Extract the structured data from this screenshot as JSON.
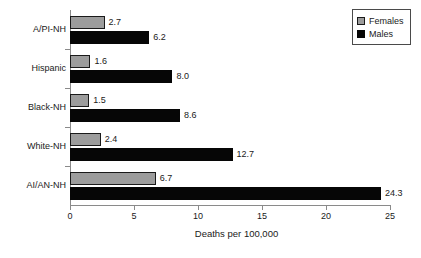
{
  "chart_data": {
    "type": "bar",
    "orientation": "horizontal",
    "title": "",
    "xlabel": "Deaths per 100,000",
    "ylabel": "",
    "categories": [
      "A/PI-NH",
      "Hispanic",
      "Black-NH",
      "White-NH",
      "AI/AN-NH"
    ],
    "series": [
      {
        "name": "Females",
        "color": "#9c9c9c",
        "values": [
          2.7,
          1.6,
          1.5,
          2.4,
          6.7
        ],
        "labels": [
          "2.7",
          "1.6",
          "1.5",
          "2.4",
          "6.7"
        ]
      },
      {
        "name": "Males",
        "color": "#060606",
        "values": [
          6.2,
          8.0,
          8.6,
          12.7,
          24.3
        ],
        "labels": [
          "6.2",
          "8.0",
          "8.6",
          "12.7",
          "24.3"
        ]
      }
    ],
    "xlim": [
      0,
      25
    ],
    "xticks": [
      0,
      5,
      10,
      15,
      20,
      25
    ],
    "xtick_labels": [
      "0",
      "5",
      "10",
      "15",
      "20",
      "25"
    ],
    "grid": false,
    "legend_position": "top-right",
    "legend_entries": [
      "Females",
      "Males"
    ]
  },
  "axis": {
    "x_title": "Deaths per 100,000"
  },
  "legend": {
    "females_label": "Females",
    "males_label": "Males"
  }
}
